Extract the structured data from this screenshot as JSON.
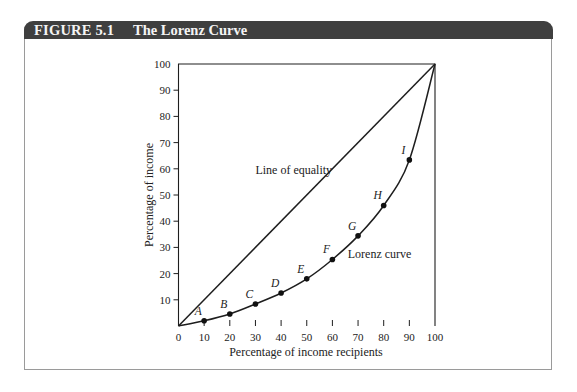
{
  "figure": {
    "number": "FIGURE 5.1",
    "title": "The Lorenz Curve",
    "header_color": "#3f3f3f",
    "border_color": "#9a9a9a"
  },
  "chart_data": {
    "type": "line",
    "title": "The Lorenz Curve",
    "xlabel": "Percentage of income recipients",
    "ylabel": "Percentage of income",
    "xlim": [
      0,
      100
    ],
    "ylim": [
      0,
      100
    ],
    "x_ticks": [
      0,
      10,
      20,
      30,
      40,
      50,
      60,
      70,
      80,
      90,
      100
    ],
    "y_ticks": [
      10,
      20,
      30,
      40,
      50,
      60,
      70,
      80,
      90,
      100
    ],
    "grid": false,
    "legend": null,
    "series": [
      {
        "name": "Line of equality",
        "x": [
          0,
          100
        ],
        "y": [
          0,
          100
        ]
      },
      {
        "name": "Lorenz curve",
        "x": [
          0,
          10,
          20,
          30,
          40,
          50,
          60,
          70,
          80,
          90,
          100
        ],
        "y": [
          0,
          2,
          4.6,
          8.4,
          12.6,
          18,
          25.4,
          34.4,
          46,
          63.4,
          100
        ]
      }
    ],
    "points": [
      {
        "label": "A",
        "x": 10,
        "y": 2
      },
      {
        "label": "B",
        "x": 20,
        "y": 4.6
      },
      {
        "label": "C",
        "x": 30,
        "y": 8.4
      },
      {
        "label": "D",
        "x": 40,
        "y": 12.6
      },
      {
        "label": "E",
        "x": 50,
        "y": 18
      },
      {
        "label": "F",
        "x": 60,
        "y": 25.4
      },
      {
        "label": "G",
        "x": 70,
        "y": 34.4
      },
      {
        "label": "H",
        "x": 80,
        "y": 46
      },
      {
        "label": "I",
        "x": 90,
        "y": 63.4
      }
    ],
    "annotations": [
      {
        "text": "Line of equality",
        "x": 30,
        "y": 58
      },
      {
        "text": "Lorenz curve",
        "x": 66,
        "y": 26
      }
    ]
  }
}
